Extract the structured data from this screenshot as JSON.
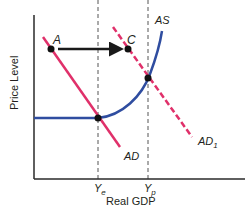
{
  "diagram": {
    "type": "AD-AS model",
    "axes": {
      "ylabel": "Price Level",
      "xlabel": "Real GDP",
      "x_ticks": [
        {
          "main": "Y",
          "sub": "e"
        },
        {
          "main": "Y",
          "sub": "p"
        }
      ]
    },
    "curves": {
      "ad": {
        "label": "AD",
        "style": "solid",
        "color": "#e0306a"
      },
      "ad1": {
        "label": "AD",
        "sub": "1",
        "style": "dashed",
        "color": "#e0306a"
      },
      "as": {
        "label": "AS",
        "style": "solid",
        "color": "#2f4da0"
      }
    },
    "points": {
      "a": {
        "label": "A"
      },
      "c": {
        "label": "C"
      }
    },
    "arrow": {
      "from": "A",
      "to": "C",
      "color": "#1a1a1a"
    },
    "colors": {
      "axis": "#2a2a2a",
      "guide": "#555555",
      "dot": "#111111"
    }
  }
}
